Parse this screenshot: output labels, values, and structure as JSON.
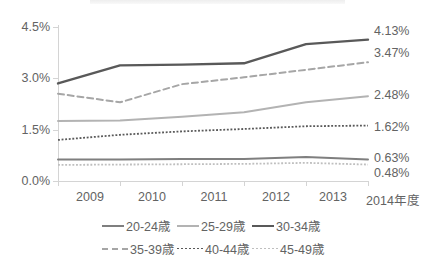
{
  "chart_data": {
    "type": "line",
    "title": "",
    "xlabel": "",
    "ylabel": "",
    "categories": [
      "2009",
      "2010",
      "2011",
      "2012",
      "2013",
      "2014年度"
    ],
    "x_axis_note": "2014年度",
    "ylim": [
      0.0,
      4.5
    ],
    "ytick_values": [
      0.0,
      1.5,
      3.0,
      4.5
    ],
    "ytick_labels": [
      "0.0%",
      "1.5%",
      "3.0%",
      "4.5%"
    ],
    "grid": false,
    "legend_position": "bottom",
    "series": [
      {
        "name": "20-24歳",
        "values": [
          0.63,
          0.63,
          0.64,
          0.64,
          0.7,
          0.63
        ],
        "end_label": "0.63%",
        "style": "solid",
        "color": "#7f7f7f",
        "width": 2.0
      },
      {
        "name": "25-29歳",
        "values": [
          1.75,
          1.77,
          1.88,
          2.01,
          2.3,
          2.48
        ],
        "end_label": "2.48%",
        "style": "solid",
        "color": "#b3b3b3",
        "width": 2.0
      },
      {
        "name": "30-34歳",
        "values": [
          2.85,
          3.38,
          3.4,
          3.44,
          4.0,
          4.13
        ],
        "end_label": "4.13%",
        "style": "solid",
        "color": "#595959",
        "width": 2.4
      },
      {
        "name": "35-39歳",
        "values": [
          2.55,
          2.3,
          2.83,
          3.03,
          3.25,
          3.47
        ],
        "end_label": "3.47%",
        "style": "dashed",
        "color": "#a6a6a6",
        "width": 2.0
      },
      {
        "name": "40-44歳",
        "values": [
          1.2,
          1.35,
          1.45,
          1.52,
          1.6,
          1.62
        ],
        "end_label": "1.62%",
        "style": "dotted",
        "color": "#595959",
        "width": 1.8
      },
      {
        "name": "45-49歳",
        "values": [
          0.47,
          0.48,
          0.49,
          0.5,
          0.53,
          0.48
        ],
        "end_label": "0.48%",
        "style": "dotted",
        "color": "#bfbfbf",
        "width": 1.8
      }
    ]
  },
  "axis": {
    "y_labels": [
      "4.5%",
      "3.0%",
      "1.5%",
      "0.0%"
    ],
    "x_labels": [
      "2009",
      "2010",
      "2011",
      "2012",
      "2013",
      "2014年度"
    ]
  },
  "end_labels": {
    "s30_34": "4.13%",
    "s35_39": "3.47%",
    "s25_29": "2.48%",
    "s40_44": "1.62%",
    "s20_24": "0.63%",
    "s45_49": "0.48%"
  },
  "legend": {
    "row1": [
      "20-24歳",
      "25-29歳",
      "30-34歳"
    ],
    "row2": [
      "35-39歳",
      "40-44歳",
      "45-49歳"
    ]
  },
  "colors": {
    "axis": "#d4d4d4",
    "text": "#636363",
    "dark": "#595959",
    "mid": "#7f7f7f",
    "light": "#b3b3b3",
    "lighter": "#bfbfbf"
  }
}
